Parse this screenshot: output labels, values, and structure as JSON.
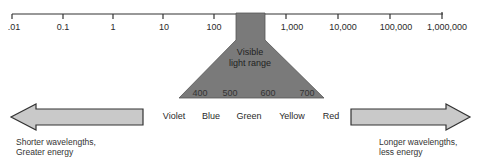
{
  "axis": {
    "ticks": [
      {
        "label": ".01",
        "x": 12
      },
      {
        "label": "0.1",
        "x": 63
      },
      {
        "label": "1",
        "x": 113
      },
      {
        "label": "10",
        "x": 163
      },
      {
        "label": "100",
        "x": 214
      },
      {
        "label": "1,000",
        "x": 296
      },
      {
        "label": "10,000",
        "x": 347
      },
      {
        "label": "100,000",
        "x": 400
      },
      {
        "label": "1,000,000",
        "x": 447
      }
    ]
  },
  "visible_range": {
    "label_line1": "Visible",
    "label_line2": "light range",
    "wavelengths": [
      "400",
      "500",
      "600",
      "700"
    ]
  },
  "colors_row": [
    "Violet",
    "Blue",
    "Green",
    "Yellow",
    "Red"
  ],
  "left_note": {
    "line1": "Shorter wavelengths,",
    "line2": "Greater energy"
  },
  "right_note": {
    "line1": "Longer wavelengths,",
    "line2": "less energy"
  },
  "palette": {
    "funnel": "#7a7a7a",
    "arrow_fill": "#c9c9c9",
    "arrow_stroke": "#333333",
    "axis": "#333333"
  }
}
